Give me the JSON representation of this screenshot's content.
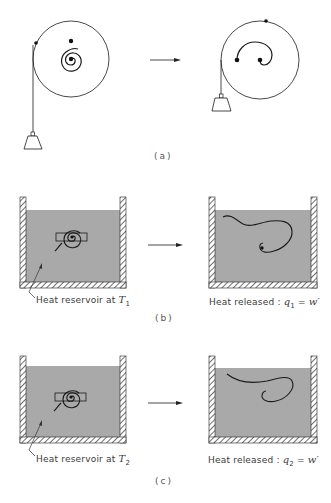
{
  "figure": {
    "panels": [
      {
        "id": "a",
        "caption": "(a)",
        "description": "Wound spring raising a weight: spiral spring unwinds and lifts the suspended weight"
      },
      {
        "id": "b",
        "caption": "(b)",
        "left_label": {
          "prefix": "Heat reservoir at ",
          "var": "T",
          "sub": "1"
        },
        "right_label": {
          "prefix": "Heat released : ",
          "var": "q",
          "sub": "1",
          "eq": " = ",
          "rhs": "w′"
        }
      },
      {
        "id": "c",
        "caption": "(c)",
        "left_label": {
          "prefix": "Heat reservoir at ",
          "var": "T",
          "sub": "2"
        },
        "right_label": {
          "prefix": "Heat released : ",
          "var": "q",
          "sub": "2",
          "eq": " = ",
          "rhs": "w′"
        }
      }
    ],
    "colors": {
      "line": "#1a1a1a",
      "fluid": "#a9a9a9",
      "wall_hatch": "#333333",
      "background": "#ffffff"
    }
  }
}
